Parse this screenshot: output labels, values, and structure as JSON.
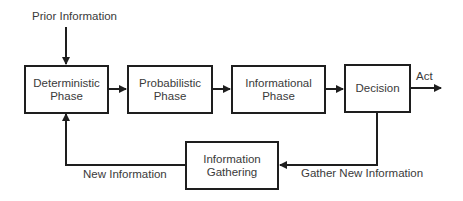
{
  "diagram": {
    "nodes": [
      {
        "id": "deterministic",
        "label": "Deterministic Phase",
        "line1": "Deterministic",
        "line2": "Phase"
      },
      {
        "id": "probabilistic",
        "label": "Probabilistic Phase",
        "line1": "Probabilistic",
        "line2": "Phase"
      },
      {
        "id": "informational",
        "label": "Informational Phase",
        "line1": "Informational",
        "line2": "Phase"
      },
      {
        "id": "decision",
        "label": "Decision",
        "line1": "Decision"
      },
      {
        "id": "gathering",
        "label": "Information Gathering",
        "line1": "Information",
        "line2": "Gathering"
      }
    ],
    "edge_labels": {
      "prior": "Prior Information",
      "act": "Act",
      "new_info": "New Information",
      "gather": "Gather New Information"
    },
    "edges": [
      {
        "from": "Prior Information",
        "to": "deterministic"
      },
      {
        "from": "deterministic",
        "to": "probabilistic"
      },
      {
        "from": "probabilistic",
        "to": "informational"
      },
      {
        "from": "informational",
        "to": "decision"
      },
      {
        "from": "decision",
        "to": "Act"
      },
      {
        "from": "decision",
        "to": "gathering",
        "label": "Gather New Information"
      },
      {
        "from": "gathering",
        "to": "deterministic",
        "label": "New Information"
      }
    ],
    "colors": {
      "stroke": "#1e1e1e",
      "text": "#3a3a3a",
      "background": "#ffffff"
    }
  }
}
